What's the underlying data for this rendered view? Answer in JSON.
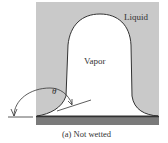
{
  "figure": {
    "labels": {
      "liquid": "Liquid",
      "vapor": "Vapor",
      "angle": "θ",
      "caption": "(a)  Not wetted"
    },
    "colors": {
      "liquid_fill": "#c9c9c9",
      "vapor_fill": "#ffffff",
      "surface": "#7a7a7a",
      "outline": "#333333"
    }
  }
}
